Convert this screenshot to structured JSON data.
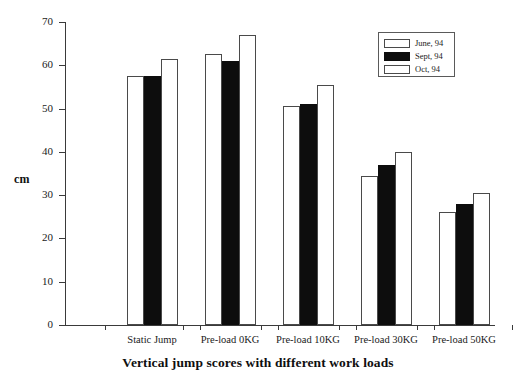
{
  "chart_data": {
    "type": "bar",
    "title": "Vertical jump scores with different work loads",
    "xlabel": "",
    "ylabel": "cm",
    "ylim": [
      0,
      70
    ],
    "yticks": [
      0,
      10,
      20,
      30,
      40,
      50,
      60,
      70
    ],
    "grid": false,
    "legend_position": "top-right",
    "categories": [
      "Static Jump",
      "Pre-load 0KG",
      "Pre-load 10KG",
      "Pre-load 30KG",
      "Pre-load 50KG"
    ],
    "series": [
      {
        "name": "June, 94",
        "style": "open",
        "values": [
          57.5,
          62.5,
          50.5,
          34.5,
          26.0
        ]
      },
      {
        "name": "Sept, 94",
        "style": "solid",
        "values": [
          57.5,
          61.0,
          51.0,
          37.0,
          28.0
        ]
      },
      {
        "name": "Oct, 94",
        "style": "open",
        "values": [
          61.5,
          67.0,
          55.5,
          40.0,
          30.5
        ]
      }
    ]
  },
  "legend": {
    "items": [
      {
        "label": "June, 94",
        "style": "open"
      },
      {
        "label": "Sept, 94",
        "style": "solid"
      },
      {
        "label": "Oct, 94",
        "style": "open"
      }
    ]
  },
  "colors": {
    "open_fill": "#ffffff",
    "open_border": "#4a4a4a",
    "solid_fill": "#0d0d0d",
    "axis": "#3a3a3a",
    "text": "#1a1a1a",
    "background": "#ffffff"
  }
}
